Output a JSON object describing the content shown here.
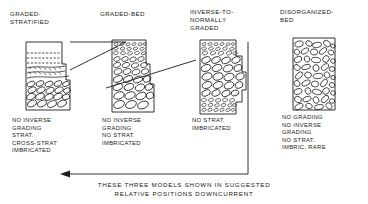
{
  "figure": {
    "type": "sedimentary-facies-model-diagram",
    "ink_color": "#1b1b1b",
    "background": "#ffffff",
    "caption": "THESE THREE MODELS SHOWN IN SUGGESTED\nRELATIVE POSITIONS DOWNCURRENT",
    "caption_arrow": {
      "name": "downcurrent-arrow",
      "direction": "left",
      "meaning": "downcurrent direction"
    }
  },
  "columns": [
    {
      "id": "graded-stratified",
      "title": "GRADED-\nSTRATIFIED",
      "description": "NO INVERSE\n   GRADING\nSTRAT.\n   CROSS-STRAT\nIMBRICATED",
      "log": {
        "name": "graded-stratified-log",
        "top_facies": "dashed stratification / sand laminae",
        "mid_facies": "cross-stratified granule laminae",
        "base_facies": "imbricated pebble clasts",
        "stepped_margin": true
      }
    },
    {
      "id": "graded-bed",
      "title": "GRADED-BED",
      "description": "NO INVERSE\n   GRADING\nNO STRAT.\nIMBRICATED",
      "log": {
        "name": "graded-bed-log",
        "top_facies": "fine granule clasts",
        "mid_facies": "medium pebble clasts",
        "base_facies": "coarse imbricated pebbles",
        "stepped_margin": true
      }
    },
    {
      "id": "inverse-to-normally-graded",
      "title": "INVERSE-TO-\nNORMALLY\nGRADED",
      "description": "NO STRAT.\nIMBRICATED",
      "log": {
        "name": "inverse-to-normally-graded-log",
        "top_facies": "fine granule clasts",
        "mid_facies": "coarse pebble clasts",
        "base_facies": "fine granule clasts",
        "stepped_margin": true
      }
    },
    {
      "id": "disorganized-bed",
      "title": "DISORGANIZED-\nBED",
      "description": "NO GRADING\nNO INVERSE\n   GRADING\nNO STRAT.\nIMBRIC. RARE",
      "log": {
        "name": "disorganized-bed-log",
        "top_facies": "unsorted mixed clasts",
        "mid_facies": "unsorted mixed clasts",
        "base_facies": "unsorted mixed clasts",
        "stepped_margin": false
      }
    }
  ]
}
